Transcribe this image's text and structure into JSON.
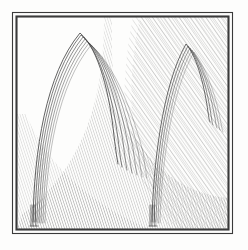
{
  "figure": {
    "medium": "engraving",
    "caption": "",
    "paper_color": "#fdfdfc",
    "ink_color": "#4a4a4a",
    "hatch_color": "#6f6f6f",
    "frame_color": "#3a3a3a",
    "width": 248,
    "height": 250
  },
  "frame": {
    "name": "plate-border",
    "outer": {
      "x": 12,
      "y": 12,
      "width": 221,
      "height": 222
    },
    "inner": {
      "x": 16,
      "y": 16,
      "width": 213,
      "height": 214
    },
    "outer_stroke": 1.1,
    "inner_stroke": 2.2
  },
  "arches": [
    {
      "id": "large-arch",
      "label": "Large arch",
      "apex": {
        "x": 80,
        "y": 33
      },
      "left_foot": {
        "x": 33,
        "y": 222
      },
      "right_tip": {
        "x": 118,
        "y": 163
      },
      "band_count": 7,
      "band_spread": 13,
      "stroke": 0.85
    },
    {
      "id": "small-arch",
      "label": "Small arch",
      "apex": {
        "x": 186,
        "y": 44
      },
      "left_foot": {
        "x": 152,
        "y": 222
      },
      "right_tip": {
        "x": 211,
        "y": 120
      },
      "band_count": 5,
      "band_spread": 8,
      "stroke": 0.8
    }
  ],
  "shading": {
    "sky_hatch": {
      "name": "upper-right-hatch",
      "angle_deg": 35,
      "spacing": 3.1,
      "opacity": 0.5,
      "description": "diagonal hatching filling the upper-right background"
    },
    "ground_hatch": {
      "name": "ground-curve-hatch",
      "angle_deg": 18,
      "spacing": 2.4,
      "opacity": 0.62,
      "description": "curved hatched band sweeping from lower-left up to the right"
    }
  }
}
